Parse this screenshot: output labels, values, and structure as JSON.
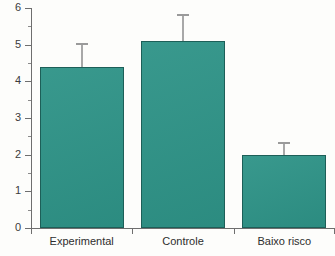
{
  "chart_data": {
    "type": "bar",
    "title": "",
    "xlabel": "",
    "ylabel": "",
    "categories": [
      "Experimental",
      "Controle",
      "Baixo risco"
    ],
    "values": [
      4.4,
      5.1,
      2.0
    ],
    "errors": [
      0.65,
      0.75,
      0.35
    ],
    "series": [
      {
        "name": "",
        "values": [
          4.4,
          5.1,
          2.0
        ],
        "errors": [
          0.65,
          0.75,
          0.35
        ]
      }
    ],
    "ylim": [
      0,
      6
    ],
    "xlim": [
      0,
      3
    ],
    "ytick_labels": [
      "0",
      "1",
      "2",
      "3",
      "4",
      "5",
      "6"
    ],
    "ytick_values": [
      0,
      1,
      2,
      3,
      4,
      5,
      6
    ],
    "yminor_values": [
      0.5,
      1.5,
      2.5,
      3.5,
      4.5,
      5.5
    ],
    "grid": false,
    "legend": false,
    "legend_position": "none",
    "bar_color": "#2e9387",
    "bar_edge_color": "#1d5f58",
    "error_color": "#9a9a9a",
    "axis_color": "#6e6e6e",
    "background_color": "#fdfdfb"
  }
}
